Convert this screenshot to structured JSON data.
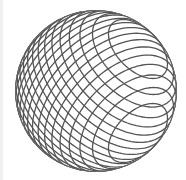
{
  "figure": {
    "center": [
      96,
      91
    ],
    "radius": 81,
    "lines_per_family": 19,
    "families": [
      {
        "axis_angle_deg": 45,
        "tilt_deg": 55
      },
      {
        "axis_angle_deg": -45,
        "tilt_deg": 55
      }
    ],
    "stroke_color": "#555555",
    "stroke_width": 1.3,
    "outline_color": "#666666",
    "background": "#ffffff"
  }
}
